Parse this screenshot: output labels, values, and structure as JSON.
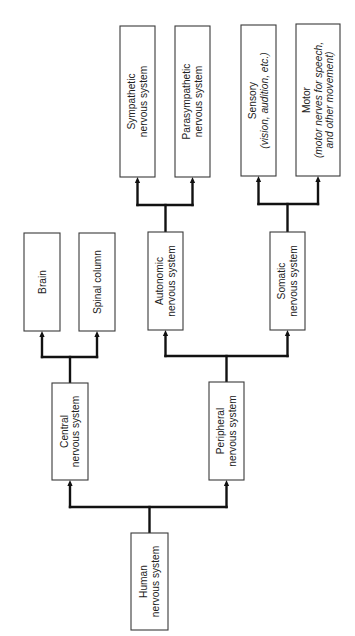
{
  "diagram": {
    "orientation": "rotated-90-ccw",
    "nodes": [
      {
        "id": "human",
        "lines": [
          "Human",
          "nervous system"
        ],
        "italic_lines": []
      },
      {
        "id": "central",
        "lines": [
          "Central",
          "nervous system"
        ],
        "italic_lines": []
      },
      {
        "id": "peripheral",
        "lines": [
          "Peripheral",
          "nervous system"
        ],
        "italic_lines": []
      },
      {
        "id": "brain",
        "lines": [
          "Brain"
        ],
        "italic_lines": []
      },
      {
        "id": "spinal",
        "lines": [
          "Spinal column"
        ],
        "italic_lines": []
      },
      {
        "id": "autonomic",
        "lines": [
          "Autonomic",
          "nervous system"
        ],
        "italic_lines": []
      },
      {
        "id": "somatic",
        "lines": [
          "Somatic",
          "nervous system"
        ],
        "italic_lines": []
      },
      {
        "id": "sympathetic",
        "lines": [
          "Sympathetic",
          "nervous system"
        ],
        "italic_lines": []
      },
      {
        "id": "parasympathetic",
        "lines": [
          "Parasympathetic",
          "nervous system"
        ],
        "italic_lines": []
      },
      {
        "id": "sensory",
        "lines": [
          "Sensory",
          "(vision, audition, etc.)"
        ],
        "italic_lines": [
          1
        ]
      },
      {
        "id": "motor",
        "lines": [
          "Motor",
          "(motor nerves for speech,",
          "and other movement)"
        ],
        "italic_lines": [
          1,
          2
        ]
      }
    ],
    "edges": [
      {
        "from": "human",
        "to": [
          "central",
          "peripheral"
        ]
      },
      {
        "from": "central",
        "to": [
          "brain",
          "spinal"
        ]
      },
      {
        "from": "peripheral",
        "to": [
          "autonomic",
          "somatic"
        ]
      },
      {
        "from": "autonomic",
        "to": [
          "sympathetic",
          "parasympathetic"
        ]
      },
      {
        "from": "somatic",
        "to": [
          "sensory",
          "motor"
        ]
      }
    ],
    "colors": {
      "box_border": "#3a3a3a",
      "connector": "#111111",
      "text": "#222222",
      "background": "#ffffff"
    }
  }
}
